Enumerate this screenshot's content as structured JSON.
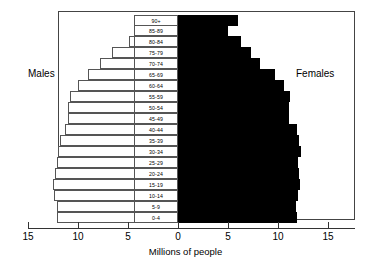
{
  "chart_data": {
    "type": "bar",
    "subtype": "population-pyramid",
    "title": "",
    "xlabel": "Millions of people",
    "ylabel": "",
    "xlim": [
      -15,
      15
    ],
    "xticks": [
      15,
      10,
      5,
      0,
      5,
      10,
      15
    ],
    "grid": false,
    "legend_position": "inline-annotations",
    "categories": [
      "90+",
      "85-89",
      "80-84",
      "75-79",
      "70-74",
      "65-69",
      "60-64",
      "55-59",
      "50-54",
      "45-49",
      "40-44",
      "35-39",
      "30-34",
      "25-29",
      "20-24",
      "15-19",
      "10-14",
      "5-9",
      "0-4"
    ],
    "series": [
      {
        "name": "Males",
        "side": "left",
        "color": "#ffffff",
        "values": [
          2.8,
          3.4,
          4.9,
          6.6,
          7.8,
          9.0,
          10.0,
          10.8,
          11.0,
          11.0,
          11.3,
          11.8,
          12.0,
          12.1,
          12.3,
          12.5,
          12.4,
          12.1,
          12.1
        ]
      },
      {
        "name": "Females",
        "side": "right",
        "color": "#000000",
        "values": [
          6.0,
          5.0,
          6.3,
          7.3,
          8.2,
          9.7,
          10.6,
          11.2,
          11.1,
          11.1,
          11.9,
          12.1,
          12.3,
          12.0,
          12.1,
          12.2,
          12.0,
          11.8,
          11.9
        ]
      }
    ],
    "annotations": [
      {
        "text": "Males",
        "position": "left"
      },
      {
        "text": "Females",
        "position": "right"
      }
    ]
  },
  "axis": {
    "tick_labels": [
      "15",
      "10",
      "5",
      "0",
      "5",
      "10",
      "15"
    ],
    "title": "Millions of people"
  },
  "labels": {
    "males": "Males",
    "females": "Females"
  }
}
